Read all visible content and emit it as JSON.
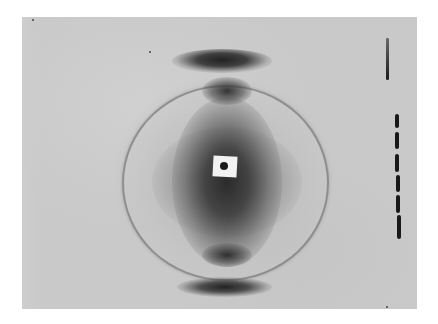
{
  "image": {
    "subject": "X-ray diffraction photograph",
    "features": [
      "central beam stop (white square) with dark dot",
      "dark diffuse central region",
      "concentric faint circular ring",
      "dark meridional arcs above and below center",
      "vertical dashed streak marks at right edge"
    ],
    "colors": {
      "background": "#ffffff",
      "film": "#c9c9c9",
      "dark": "#1a1a1a",
      "beam_stop": "#f2f2f2"
    }
  }
}
